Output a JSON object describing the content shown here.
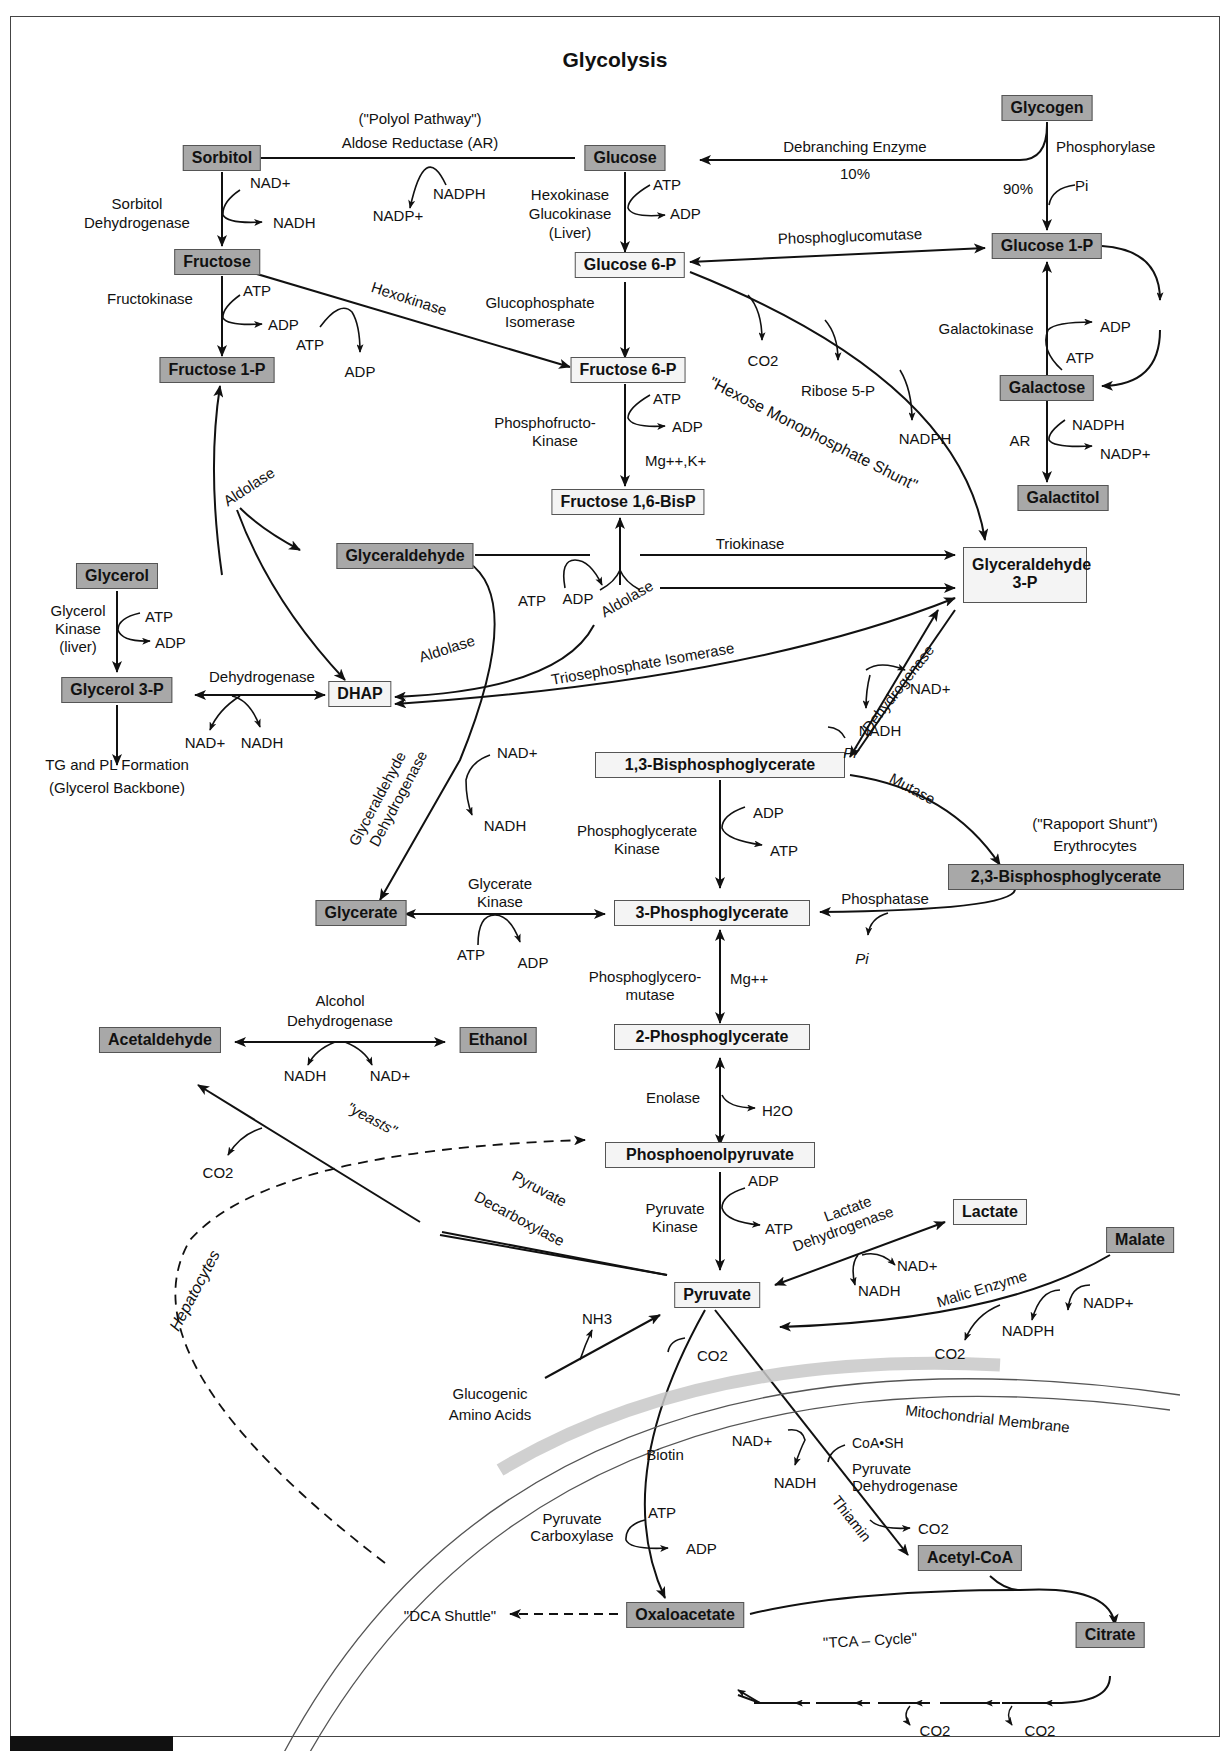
{
  "title": "Glycolysis",
  "nodes": {
    "glycogen": "Glycogen",
    "glucose": "Glucose",
    "sorbitol": "Sorbitol",
    "fructose": "Fructose",
    "fructose1p": "Fructose 1-P",
    "glucose6p": "Glucose 6-P",
    "glucose1p": "Glucose 1-P",
    "fructose6p": "Fructose 6-P",
    "fructose16bisp": "Fructose 1,6-BisP",
    "galactose": "Galactose",
    "galactitol": "Galactitol",
    "glyceraldehyde": "Glyceraldehyde",
    "glyceraldehyde3p_1": "Glyceraldehyde",
    "glyceraldehyde3p_2": "3-P",
    "glycerol": "Glycerol",
    "glycerol3p": "Glycerol 3-P",
    "dhap": "DHAP",
    "bpg13": "1,3-Bisphosphoglycerate",
    "bpg23": "2,3-Bisphosphoglycerate",
    "glycerate": "Glycerate",
    "pg3": "3-Phosphoglycerate",
    "pg2": "2-Phosphoglycerate",
    "acetaldehyde": "Acetaldehyde",
    "ethanol": "Ethanol",
    "pep": "Phosphoenolpyruvate",
    "pyruvate": "Pyruvate",
    "lactate": "Lactate",
    "malate": "Malate",
    "acetylcoa": "Acetyl-CoA",
    "oxaloacetate": "Oxaloacetate",
    "citrate": "Citrate"
  },
  "enzymes": {
    "polyol": "(\"Polyol Pathway\")",
    "aldose_reductase": "Aldose Reductase  (AR)",
    "debranching": "Debranching Enzyme",
    "debranching_pct": "10%",
    "phosphorylase": "Phosphorylase",
    "phosphorylase_pct": "90%",
    "sorbitol_dh_1": "Sorbitol",
    "sorbitol_dh_2": "Dehydrogenase",
    "hexokinase_1": "Hexokinase",
    "hexokinase_2": "Glucokinase",
    "hexokinase_3": "(Liver)",
    "phosphoglucomutase": "Phosphoglucomutase",
    "fructokinase": "Fructokinase",
    "hexokinase_diag": "Hexokinase",
    "gpi_1": "Glucophosphate",
    "gpi_2": "Isomerase",
    "galactokinase": "Galactokinase",
    "ar": "AR",
    "pfk_1": "Phosphofructo-",
    "pfk_2": "Kinase",
    "pfk_cofactor": "Mg++,K+",
    "hms": "\"Hexose Monophosphate Shunt\"",
    "ribose5p": "Ribose 5-P",
    "aldolase_1": "Aldolase",
    "aldolase_2": "Aldolase",
    "aldolase_3": "Aldolase",
    "triokinase": "Triokinase",
    "tpi": "Triosephosphate Isomerase",
    "glycerol_kinase_1": "Glycerol",
    "glycerol_kinase_2": "Kinase",
    "glycerol_kinase_3": "(liver)",
    "g3p_dh": "Dehydrogenase",
    "tg_pl_1": "TG and PL Formation",
    "tg_pl_2": "(Glycerol Backbone)",
    "gapdh_diag": "Dehydrogenase",
    "gald_dh_1": "Glyceraldehyde",
    "gald_dh_2": "Dehydrogenase",
    "mutase": "Mutase",
    "rapoport_1": "(\"Rapoport Shunt\")",
    "rapoport_2": "Erythrocytes",
    "pgk_1": "Phosphoglycerate",
    "pgk_2": "Kinase",
    "glycerate_kinase_1": "Glycerate",
    "glycerate_kinase_2": "Kinase",
    "phosphatase": "Phosphatase",
    "pgm_1": "Phosphoglycero-",
    "pgm_2": "mutase",
    "pgm_cofactor": "Mg++",
    "adh_1": "Alcohol",
    "adh_2": "Dehydrogenase",
    "enolase": "Enolase",
    "yeasts": "\"yeasts\"",
    "pdc_1": "Pyruvate",
    "pdc_2": "Decarboxylase",
    "pk_1": "Pyruvate",
    "pk_2": "Kinase",
    "ldh_1": "Lactate",
    "ldh_2": "Dehydrogenase",
    "malic_enzyme": "Malic Enzyme",
    "hepatocytes": "Hepatocytes",
    "glucogenic_1": "Glucogenic",
    "glucogenic_2": "Amino Acids",
    "mito_membrane": "Mitochondrial Membrane",
    "biotin": "Biotin",
    "pc_1": "Pyruvate",
    "pc_2": "Carboxylase",
    "coash": "CoA•SH",
    "pdh_1": "Pyruvate",
    "pdh_2": "Dehydrogenase",
    "thiamin": "Thiamin",
    "dca_shuttle": "\"DCA Shuttle\"",
    "tca_cycle": "\"TCA – Cycle\""
  },
  "cofactors": {
    "nadp_ar": "NADP+",
    "nadph_ar": "NADPH",
    "nad_sdh": "NAD+",
    "nadh_sdh": "NADH",
    "atp_hk": "ATP",
    "adp_hk": "ADP",
    "pi_phos": "Pi",
    "atp_fk": "ATP",
    "adp_fk": "ADP",
    "atp_hk2": "ATP",
    "adp_hk2": "ADP",
    "co2_hms": "CO2",
    "nadph_hms": "NADPH",
    "adp_galk": "ADP",
    "atp_galk": "ATP",
    "nadph_gal": "NADPH",
    "nadp_gal": "NADP+",
    "atp_pfk": "ATP",
    "adp_pfk": "ADP",
    "atp_tk": "ATP",
    "adp_tk": "ADP",
    "atp_glk": "ATP",
    "adp_glk": "ADP",
    "nad_g3pdh": "NAD+",
    "nadh_g3pdh": "NADH",
    "nad_gapdh": "NAD+",
    "nadh_gapdh": "NADH",
    "pi_gapdh": "Pi",
    "nad_galdh": "NAD+",
    "nadh_galdh": "NADH",
    "adp_pgk": "ADP",
    "atp_pgk": "ATP",
    "atp_gk": "ATP",
    "adp_gk": "ADP",
    "pi_phosphatase": "Pi",
    "nadh_adh": "NADH",
    "nad_adh": "NAD+",
    "co2_pdc": "CO2",
    "h2o_enolase": "H2O",
    "adp_pk": "ADP",
    "atp_pk": "ATP",
    "nad_ldh": "NAD+",
    "nadh_ldh": "NADH",
    "nadp_me": "NADP+",
    "nadph_me": "NADPH",
    "co2_me": "CO2",
    "nh3": "NH3",
    "co2_pc": "CO2",
    "atp_pc": "ATP",
    "adp_pc": "ADP",
    "nad_pdh": "NAD+",
    "nadh_pdh": "NADH",
    "co2_pdh": "CO2",
    "co2_tca1": "CO2",
    "co2_tca2": "CO2"
  }
}
